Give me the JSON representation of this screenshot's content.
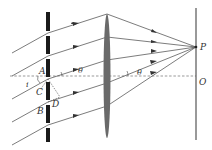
{
  "diagram": {
    "labels": {
      "A": "A",
      "B": "B",
      "C": "C",
      "D": "D",
      "P": "P",
      "O": "O",
      "i": "i",
      "theta_left": "θ",
      "theta_right": "θ"
    },
    "colors": {
      "line": "#444444",
      "grating": "#1a1a1a",
      "lens": "#6a6a6a",
      "screen": "#555555"
    }
  }
}
